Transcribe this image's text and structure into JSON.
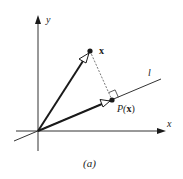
{
  "figure": {
    "caption": "(a)",
    "axes": {
      "x_label": "x",
      "y_label": "y"
    },
    "line_label": "l",
    "vector_x_label": "x",
    "projection_label_prefix": "P(",
    "projection_label_arg": "x",
    "projection_label_suffix": ")",
    "colors": {
      "ink": "#1a1a1a",
      "axis": "#333333",
      "dashed": "#555555",
      "background": "#ffffff"
    }
  }
}
